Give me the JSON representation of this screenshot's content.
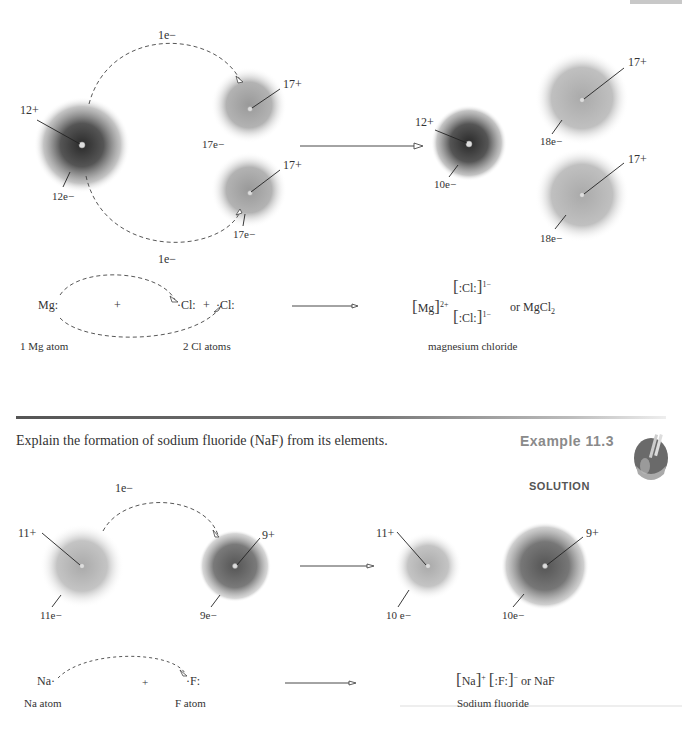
{
  "mgcl2": {
    "electron_transfer_top": "1e−",
    "electron_transfer_bottom": "1e−",
    "mg_atom": {
      "nucleus": "12+",
      "electrons": "12e−"
    },
    "cl_atom_top": {
      "nucleus": "17+",
      "electrons": "17e−"
    },
    "cl_atom_bottom": {
      "nucleus": "17+",
      "electrons": "17e−"
    },
    "mg_ion": {
      "nucleus": "12+",
      "electrons": "10e−"
    },
    "cl_ion_top": {
      "nucleus": "17+",
      "electrons": "18e−"
    },
    "cl_ion_bottom": {
      "nucleus": "17+",
      "electrons": "18e−"
    },
    "lewis": {
      "mg": "Mg",
      "plus1": "+",
      "cl1": "Cl",
      "plus2": "+",
      "cl2": "Cl",
      "mg_label": "1 Mg atom",
      "cl_label": "2 Cl atoms",
      "product_mg": "Mg",
      "product_mg_charge": "2+",
      "product_cl": "Cl",
      "product_cl_charge": "1−",
      "or_text": "or MgCl",
      "or_sub": "2",
      "product_label": "magnesium chloride"
    }
  },
  "example": {
    "prompt": "Explain the formation of sodium fluoride (NaF) from its elements.",
    "title": "Example 11.3",
    "solution_label": "SOLUTION"
  },
  "naf": {
    "electron_transfer": "1e−",
    "na_atom": {
      "nucleus": "11+",
      "electrons": "11e−"
    },
    "f_atom": {
      "nucleus": "9+",
      "electrons": "9e−"
    },
    "na_ion": {
      "nucleus": "11+",
      "electrons": "10 e−"
    },
    "f_ion": {
      "nucleus": "9+",
      "electrons": "10e−"
    },
    "lewis": {
      "na": "Na",
      "plus": "+",
      "f": "F",
      "na_label": "Na atom",
      "f_label": "F atom",
      "product_na": "Na",
      "product_na_charge": "+",
      "product_f": "F",
      "product_f_charge": "−",
      "or_text": "or NaF",
      "product_label": "Sodium fluoride"
    }
  }
}
